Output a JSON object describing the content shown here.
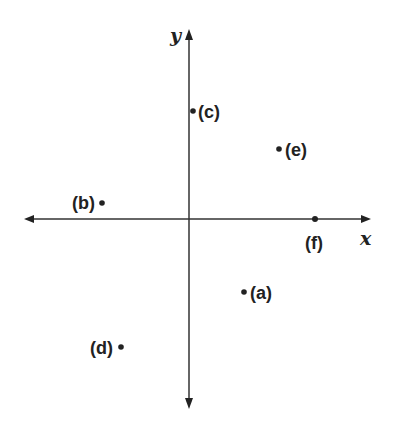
{
  "diagram": {
    "type": "coordinate-plane",
    "axes": {
      "x_label": "x",
      "y_label": "y",
      "origin_px": [
        189,
        219
      ]
    },
    "points": [
      {
        "id": "a",
        "label": "(a)",
        "px": [
          244,
          292
        ],
        "quadrant": "IV",
        "label_side": "right"
      },
      {
        "id": "b",
        "label": "(b)",
        "px": [
          102,
          203
        ],
        "quadrant": "II",
        "label_side": "left"
      },
      {
        "id": "c",
        "label": "(c)",
        "px": [
          193,
          111
        ],
        "quadrant": "positive y-axis",
        "label_side": "right"
      },
      {
        "id": "d",
        "label": "(d)",
        "px": [
          121,
          347
        ],
        "quadrant": "III",
        "label_side": "left"
      },
      {
        "id": "e",
        "label": "(e)",
        "px": [
          279,
          149
        ],
        "quadrant": "I",
        "label_side": "right"
      },
      {
        "id": "f",
        "label": "(f)",
        "px": [
          315,
          219
        ],
        "quadrant": "positive x-axis",
        "label_side": "below"
      }
    ],
    "colors": {
      "ink": "#222222",
      "background": "#ffffff"
    }
  }
}
